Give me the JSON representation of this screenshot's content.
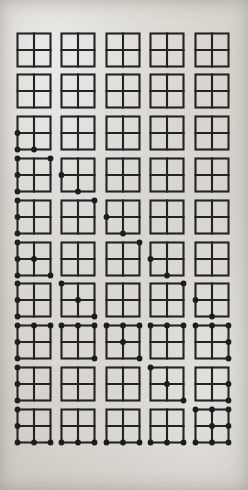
{
  "page": {
    "width": 248,
    "height": 490,
    "background_color": "#dedbd4",
    "ink_color": "#232323",
    "dot_color": "#1c1c1c"
  },
  "layout": {
    "columns": 5,
    "rows": 10,
    "origin_x": 17,
    "origin_y": 33,
    "col_pitch": 44.5,
    "row_pitch": 41.8,
    "square_size": 33,
    "stroke_width": 2.1,
    "dot_radius": 2.9
  },
  "node_names": [
    "top-left",
    "top-middle",
    "top-right",
    "middle-left",
    "center",
    "middle-right",
    "bottom-left",
    "bottom-middle",
    "bottom-right"
  ],
  "figures": [
    {
      "row": 1,
      "col": 1,
      "dots": []
    },
    {
      "row": 1,
      "col": 2,
      "dots": []
    },
    {
      "row": 1,
      "col": 3,
      "dots": []
    },
    {
      "row": 1,
      "col": 4,
      "dots": []
    },
    {
      "row": 1,
      "col": 5,
      "dots": []
    },
    {
      "row": 2,
      "col": 1,
      "dots": []
    },
    {
      "row": 2,
      "col": 2,
      "dots": []
    },
    {
      "row": 2,
      "col": 3,
      "dots": []
    },
    {
      "row": 2,
      "col": 4,
      "dots": []
    },
    {
      "row": 2,
      "col": 5,
      "dots": []
    },
    {
      "row": 3,
      "col": 1,
      "dots": [
        "middle-left",
        "bottom-left",
        "bottom-middle"
      ]
    },
    {
      "row": 3,
      "col": 2,
      "dots": []
    },
    {
      "row": 3,
      "col": 3,
      "dots": []
    },
    {
      "row": 3,
      "col": 4,
      "dots": []
    },
    {
      "row": 3,
      "col": 5,
      "dots": []
    },
    {
      "row": 4,
      "col": 1,
      "dots": [
        "top-left",
        "top-right",
        "middle-left",
        "bottom-left"
      ]
    },
    {
      "row": 4,
      "col": 2,
      "dots": [
        "middle-left",
        "bottom-middle"
      ]
    },
    {
      "row": 4,
      "col": 3,
      "dots": []
    },
    {
      "row": 4,
      "col": 4,
      "dots": []
    },
    {
      "row": 4,
      "col": 5,
      "dots": []
    },
    {
      "row": 5,
      "col": 1,
      "dots": [
        "top-left",
        "middle-left",
        "bottom-left"
      ]
    },
    {
      "row": 5,
      "col": 2,
      "dots": [
        "top-right"
      ]
    },
    {
      "row": 5,
      "col": 3,
      "dots": [
        "middle-left",
        "bottom-middle"
      ]
    },
    {
      "row": 5,
      "col": 4,
      "dots": []
    },
    {
      "row": 5,
      "col": 5,
      "dots": []
    },
    {
      "row": 6,
      "col": 1,
      "dots": [
        "top-left",
        "middle-left",
        "center",
        "bottom-left",
        "bottom-right"
      ]
    },
    {
      "row": 6,
      "col": 2,
      "dots": []
    },
    {
      "row": 6,
      "col": 3,
      "dots": [
        "top-right"
      ]
    },
    {
      "row": 6,
      "col": 4,
      "dots": [
        "middle-left",
        "bottom-middle"
      ]
    },
    {
      "row": 6,
      "col": 5,
      "dots": []
    },
    {
      "row": 7,
      "col": 1,
      "dots": [
        "top-left",
        "middle-left",
        "bottom-left"
      ]
    },
    {
      "row": 7,
      "col": 2,
      "dots": [
        "top-left",
        "center",
        "bottom-right"
      ]
    },
    {
      "row": 7,
      "col": 3,
      "dots": []
    },
    {
      "row": 7,
      "col": 4,
      "dots": [
        "top-right"
      ]
    },
    {
      "row": 7,
      "col": 5,
      "dots": [
        "middle-left",
        "bottom-middle"
      ]
    },
    {
      "row": 8,
      "col": 1,
      "dots": [
        "top-left",
        "top-middle",
        "top-right",
        "middle-left",
        "bottom-left"
      ]
    },
    {
      "row": 8,
      "col": 2,
      "dots": [
        "top-left",
        "top-middle",
        "top-right",
        "bottom-right"
      ]
    },
    {
      "row": 8,
      "col": 3,
      "dots": [
        "top-left",
        "top-middle",
        "top-right",
        "center",
        "bottom-right"
      ]
    },
    {
      "row": 8,
      "col": 4,
      "dots": [
        "top-left",
        "top-middle",
        "top-right"
      ]
    },
    {
      "row": 8,
      "col": 5,
      "dots": [
        "top-left",
        "top-middle",
        "top-right",
        "middle-right",
        "bottom-right"
      ]
    },
    {
      "row": 9,
      "col": 1,
      "dots": [
        "top-left",
        "middle-left",
        "bottom-left"
      ]
    },
    {
      "row": 9,
      "col": 2,
      "dots": []
    },
    {
      "row": 9,
      "col": 3,
      "dots": []
    },
    {
      "row": 9,
      "col": 4,
      "dots": [
        "top-left",
        "center",
        "bottom-right"
      ]
    },
    {
      "row": 9,
      "col": 5,
      "dots": [
        "middle-right",
        "bottom-right"
      ]
    },
    {
      "row": 10,
      "col": 1,
      "dots": [
        "top-left",
        "middle-left",
        "bottom-left",
        "bottom-middle",
        "bottom-right"
      ]
    },
    {
      "row": 10,
      "col": 2,
      "dots": [
        "bottom-left",
        "bottom-middle",
        "bottom-right"
      ]
    },
    {
      "row": 10,
      "col": 3,
      "dots": [
        "bottom-left",
        "bottom-middle",
        "bottom-right"
      ]
    },
    {
      "row": 10,
      "col": 4,
      "dots": [
        "bottom-left",
        "bottom-middle",
        "bottom-right"
      ]
    },
    {
      "row": 10,
      "col": 5,
      "dots": [
        "top-left",
        "top-middle",
        "top-right",
        "center",
        "middle-right",
        "bottom-left",
        "bottom-middle",
        "bottom-right"
      ]
    }
  ]
}
